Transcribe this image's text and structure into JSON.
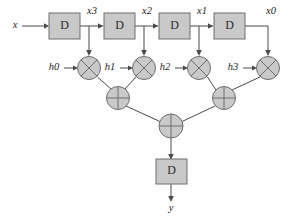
{
  "figure": {
    "canvas": {
      "width": 295,
      "height": 217
    },
    "colors": {
      "background": "#fefefe",
      "block_fill": "#c9c9c9",
      "block_stroke": "#6e6e6e",
      "wire": "#4a4a4a",
      "text": "#1f1f1f"
    }
  },
  "signals": {
    "input": "x",
    "output": "y",
    "taps": [
      "x3",
      "x2",
      "x1",
      "x0"
    ],
    "coefficients": [
      "h0",
      "h1",
      "h2",
      "h3"
    ]
  },
  "delay_blocks": [
    {
      "id": "d1",
      "label": "D"
    },
    {
      "id": "d2",
      "label": "D"
    },
    {
      "id": "d3",
      "label": "D"
    },
    {
      "id": "d4",
      "label": "D"
    },
    {
      "id": "d-out",
      "label": "D"
    }
  ],
  "multipliers": [
    {
      "id": "mul0",
      "glyph": "cross",
      "coefficient": "h0",
      "tap": "x3"
    },
    {
      "id": "mul1",
      "glyph": "cross",
      "coefficient": "h1",
      "tap": "x2"
    },
    {
      "id": "mul2",
      "glyph": "cross",
      "coefficient": "h2",
      "tap": "x1"
    },
    {
      "id": "mul3",
      "glyph": "cross",
      "coefficient": "h3",
      "tap": "x0"
    }
  ],
  "adders": [
    {
      "id": "add-left",
      "glyph": "plus"
    },
    {
      "id": "add-right",
      "glyph": "plus"
    },
    {
      "id": "add-final",
      "glyph": "plus"
    }
  ]
}
